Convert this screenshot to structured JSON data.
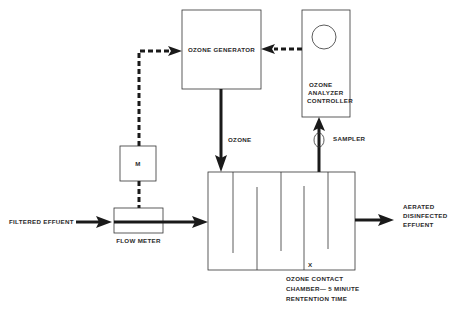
{
  "diagram": {
    "nodes": {
      "ozone_generator": {
        "label": "OZONE GENERATOR"
      },
      "analyzer": {
        "lines": [
          "OZONE",
          "ANALYZER",
          "CONTROLLER"
        ]
      },
      "meter_m": {
        "label": "M"
      },
      "flow_meter": {
        "label": "FLOW METER"
      },
      "contact_chamber": {
        "marker": "X",
        "lines": [
          "OZONE CONTACT",
          "CHAMBER— 5 MINUTE",
          "RENTENTION TIME"
        ]
      }
    },
    "edges": {
      "ozone": {
        "label": "OZONE"
      },
      "sampler": {
        "label": "SAMPLER"
      },
      "inlet": {
        "label": "FILTERED EFFUENT"
      },
      "outlet": {
        "lines": [
          "AERATED",
          "DISINFECTED",
          "EFFUENT"
        ]
      }
    },
    "colors": {
      "line": "#1a1a1a",
      "text": "#2a2a2a",
      "background": "#ffffff"
    }
  }
}
